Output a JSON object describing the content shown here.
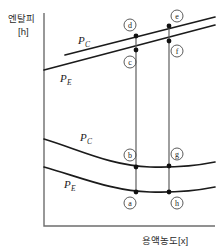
{
  "figure": {
    "top_cut_text": "",
    "axes": {
      "y_label_line1": "엔탈피",
      "y_label_line2": "[h]",
      "x_label": "용액농도[x]"
    },
    "curves": [
      {
        "id": "upper-pc",
        "label": "P",
        "sub": "C",
        "kind": "line",
        "label_x": 78,
        "label_y": 44
      },
      {
        "id": "upper-pe",
        "label": "P",
        "sub": "E",
        "kind": "line",
        "label_x": 60,
        "label_y": 82
      },
      {
        "id": "lower-pc",
        "label": "P",
        "sub": "C",
        "kind": "curve",
        "label_x": 80,
        "label_y": 141
      },
      {
        "id": "lower-pe",
        "label": "P",
        "sub": "E",
        "kind": "curve",
        "label_x": 64,
        "label_y": 188
      }
    ],
    "points": [
      {
        "id": "a",
        "letter": "a",
        "px": 136,
        "py": 192,
        "lx": 130,
        "ly": 203
      },
      {
        "id": "b",
        "letter": "b",
        "px": 136,
        "py": 167,
        "lx": 130,
        "ly": 155
      },
      {
        "id": "c",
        "letter": "c",
        "px": 136,
        "py": 50,
        "lx": 130,
        "ly": 62
      },
      {
        "id": "d",
        "letter": "d",
        "px": 136,
        "py": 36,
        "lx": 130,
        "ly": 25
      },
      {
        "id": "e",
        "letter": "e",
        "px": 169,
        "py": 26,
        "lx": 177,
        "ly": 16
      },
      {
        "id": "f",
        "letter": "f",
        "px": 169,
        "py": 41,
        "lx": 177,
        "ly": 51
      },
      {
        "id": "g",
        "letter": "g",
        "px": 169,
        "py": 166,
        "lx": 177,
        "ly": 154
      },
      {
        "id": "h",
        "letter": "h",
        "px": 169,
        "py": 192,
        "lx": 177,
        "ly": 203
      }
    ],
    "connectors": [
      {
        "id": "left-connector",
        "x": 136,
        "y1": 36,
        "y2": 192
      },
      {
        "id": "right-connector",
        "x": 169,
        "y1": 26,
        "y2": 192
      }
    ],
    "colors": {
      "axis": "#6d6d6d",
      "curve": "#1b1b1b",
      "connector": "#5e5e5e",
      "point": "#111111",
      "background": "#ffffff"
    }
  }
}
